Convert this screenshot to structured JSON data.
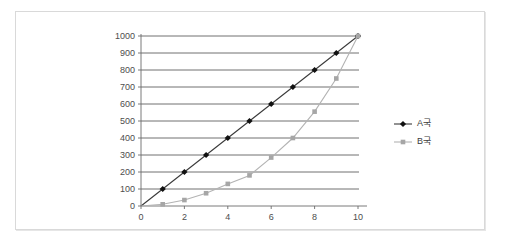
{
  "chart_data": {
    "type": "line",
    "title": "",
    "subtitle": "",
    "xlabel": "",
    "ylabel": "",
    "x": [
      0,
      1,
      2,
      3,
      4,
      5,
      6,
      7,
      8,
      9,
      10
    ],
    "xlim": [
      0,
      10
    ],
    "ylim": [
      0,
      1000
    ],
    "xticks": [
      0,
      2,
      4,
      6,
      8,
      10
    ],
    "xtick_labels": [
      "0",
      "2",
      "4",
      "6",
      "8",
      "10"
    ],
    "yticks": [
      0,
      100,
      200,
      300,
      400,
      500,
      600,
      700,
      800,
      900,
      1000
    ],
    "ytick_labels": [
      "0",
      "100",
      "200",
      "300",
      "400",
      "500",
      "600",
      "700",
      "800",
      "900",
      "1000"
    ],
    "grid": "horizontal",
    "legend_position": "right",
    "series": [
      {
        "name": "A국",
        "marker": "diamond",
        "color": "#111111",
        "line_color": "#3a3a3a",
        "values": [
          0,
          100,
          200,
          300,
          400,
          500,
          600,
          700,
          800,
          900,
          1000
        ]
      },
      {
        "name": "B국",
        "marker": "square",
        "color": "#a6a6a6",
        "line_color": "#b3b3b3",
        "values": [
          0,
          10,
          35,
          75,
          130,
          180,
          285,
          400,
          555,
          750,
          1000
        ]
      }
    ],
    "legend": [
      {
        "label": "A국",
        "marker": "diamond",
        "color": "#111111"
      },
      {
        "label": "B국",
        "marker": "square",
        "color": "#a6a6a6"
      }
    ]
  },
  "axis": {
    "y_labels": [
      "1000",
      "900",
      "800",
      "700",
      "600",
      "500",
      "400",
      "300",
      "200",
      "100",
      "0"
    ],
    "x_labels": [
      "0",
      "2",
      "4",
      "6",
      "8",
      "10"
    ]
  },
  "colors": {
    "series_a": "#111111",
    "series_b": "#a6a6a6",
    "gridline": "#4d4d4d",
    "axis": "#6b6b6b",
    "frame": "#d9d9d9",
    "background": "#ffffff",
    "tick_text": "#4d4d4d"
  }
}
